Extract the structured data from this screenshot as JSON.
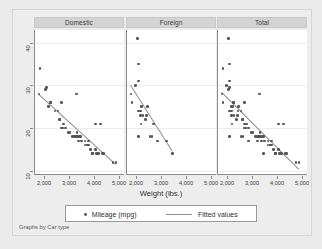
{
  "figure": {
    "footnote": "Graphs by Car type",
    "background_color": "#ebebeb",
    "plot_background_color": "#ffffff",
    "marker_color": "#555555",
    "fit_line_color": "#8d8d8d",
    "panel_header_color": "#d3d3d3"
  },
  "legend": {
    "entries": [
      {
        "label": "Mileage (mpg)",
        "symbol": "dot"
      },
      {
        "label": "Fitted values",
        "symbol": "line"
      }
    ]
  },
  "chart_data": {
    "type": "scatter",
    "title": "",
    "subtitle": "",
    "xlabel": "Weight (lbs.)",
    "ylabel": "",
    "xlim": [
      1600,
      5200
    ],
    "ylim": [
      9,
      43
    ],
    "xticks": [
      2000,
      3000,
      4000,
      5000
    ],
    "xtick_labels": [
      "2,000",
      "3,000",
      "4,000",
      "5,000"
    ],
    "yticks": [
      10,
      20,
      30,
      40
    ],
    "ytick_labels": [
      "10",
      "20",
      "30",
      "40"
    ],
    "grid": "horizontal",
    "legend_position": "bottom",
    "facet_by": "Car type",
    "panels": [
      {
        "label": "Domestic",
        "points": [
          [
            1800,
            34
          ],
          [
            1760,
            28
          ],
          [
            2020,
            29
          ],
          [
            2050,
            29.5
          ],
          [
            2130,
            25
          ],
          [
            2230,
            26
          ],
          [
            2230,
            26
          ],
          [
            2400,
            24
          ],
          [
            2520,
            24
          ],
          [
            2580,
            22
          ],
          [
            2600,
            22
          ],
          [
            2650,
            26
          ],
          [
            2670,
            20
          ],
          [
            2700,
            20
          ],
          [
            2750,
            21
          ],
          [
            2830,
            20
          ],
          [
            2930,
            19
          ],
          [
            3000,
            19
          ],
          [
            3100,
            18
          ],
          [
            3180,
            18
          ],
          [
            3200,
            18
          ],
          [
            3210,
            18
          ],
          [
            3250,
            18
          ],
          [
            3260,
            28
          ],
          [
            3280,
            19
          ],
          [
            3300,
            18
          ],
          [
            3350,
            17
          ],
          [
            3370,
            18
          ],
          [
            3420,
            18
          ],
          [
            3470,
            17
          ],
          [
            3600,
            17
          ],
          [
            3600,
            16
          ],
          [
            3690,
            16
          ],
          [
            3700,
            16
          ],
          [
            3730,
            16
          ],
          [
            3740,
            17
          ],
          [
            3830,
            15
          ],
          [
            3880,
            14
          ],
          [
            3900,
            14
          ],
          [
            3900,
            14
          ],
          [
            4010,
            15
          ],
          [
            4030,
            21
          ],
          [
            4060,
            14
          ],
          [
            4080,
            14
          ],
          [
            4130,
            14
          ],
          [
            4230,
            21
          ],
          [
            4290,
            14
          ],
          [
            4330,
            14
          ],
          [
            4720,
            12
          ],
          [
            4840,
            12
          ]
        ],
        "fit_line": {
          "x1": 1760,
          "y1": 28.0,
          "x2": 4840,
          "y2": 11.6
        }
      },
      {
        "label": "Foreign",
        "points": [
          [
            2020,
            41
          ],
          [
            2050,
            35
          ],
          [
            1930,
            30
          ],
          [
            2070,
            31
          ],
          [
            1760,
            28
          ],
          [
            1800,
            26
          ],
          [
            2160,
            25
          ],
          [
            2200,
            25
          ],
          [
            2050,
            24
          ],
          [
            2130,
            24
          ],
          [
            2150,
            23
          ],
          [
            2240,
            23
          ],
          [
            2410,
            25
          ],
          [
            2370,
            23
          ],
          [
            2330,
            22
          ],
          [
            2160,
            21
          ],
          [
            2650,
            21
          ],
          [
            2070,
            18
          ],
          [
            2520,
            18
          ],
          [
            2600,
            18
          ],
          [
            2830,
            17
          ],
          [
            3170,
            17
          ],
          [
            3420,
            14
          ]
        ],
        "fit_line": {
          "x1": 1760,
          "y1": 30.0,
          "x2": 3420,
          "y2": 14.6
        }
      },
      {
        "label": "Total",
        "points": [
          [
            2020,
            41
          ],
          [
            1800,
            34
          ],
          [
            2050,
            35
          ],
          [
            1930,
            30
          ],
          [
            2070,
            31
          ],
          [
            1760,
            28
          ],
          [
            2020,
            29
          ],
          [
            2050,
            29.5
          ],
          [
            1800,
            26
          ],
          [
            2130,
            25
          ],
          [
            2160,
            25
          ],
          [
            2200,
            25
          ],
          [
            2230,
            26
          ],
          [
            2230,
            26
          ],
          [
            2050,
            24
          ],
          [
            2130,
            24
          ],
          [
            2150,
            23
          ],
          [
            2240,
            23
          ],
          [
            2400,
            24
          ],
          [
            2410,
            25
          ],
          [
            2370,
            23
          ],
          [
            2330,
            22
          ],
          [
            2520,
            24
          ],
          [
            2580,
            22
          ],
          [
            2600,
            22
          ],
          [
            2160,
            21
          ],
          [
            2650,
            26
          ],
          [
            2650,
            21
          ],
          [
            2670,
            20
          ],
          [
            2700,
            20
          ],
          [
            2750,
            21
          ],
          [
            2070,
            18
          ],
          [
            2520,
            18
          ],
          [
            2600,
            18
          ],
          [
            2830,
            20
          ],
          [
            2830,
            17
          ],
          [
            2930,
            19
          ],
          [
            3000,
            19
          ],
          [
            3100,
            18
          ],
          [
            3170,
            17
          ],
          [
            3180,
            18
          ],
          [
            3200,
            18
          ],
          [
            3210,
            18
          ],
          [
            3250,
            18
          ],
          [
            3260,
            28
          ],
          [
            3280,
            19
          ],
          [
            3300,
            18
          ],
          [
            3350,
            17
          ],
          [
            3370,
            18
          ],
          [
            3420,
            18
          ],
          [
            3420,
            14
          ],
          [
            3470,
            17
          ],
          [
            3600,
            17
          ],
          [
            3600,
            16
          ],
          [
            3690,
            16
          ],
          [
            3700,
            16
          ],
          [
            3730,
            16
          ],
          [
            3740,
            17
          ],
          [
            3830,
            15
          ],
          [
            3880,
            14
          ],
          [
            3900,
            14
          ],
          [
            3900,
            14
          ],
          [
            4010,
            15
          ],
          [
            4030,
            21
          ],
          [
            4060,
            14
          ],
          [
            4080,
            14
          ],
          [
            4130,
            14
          ],
          [
            4230,
            21
          ],
          [
            4290,
            14
          ],
          [
            4330,
            14
          ],
          [
            4720,
            12
          ],
          [
            4840,
            12
          ]
        ],
        "fit_line": {
          "x1": 1760,
          "y1": 28.4,
          "x2": 4840,
          "y2": 10.4
        }
      }
    ]
  }
}
